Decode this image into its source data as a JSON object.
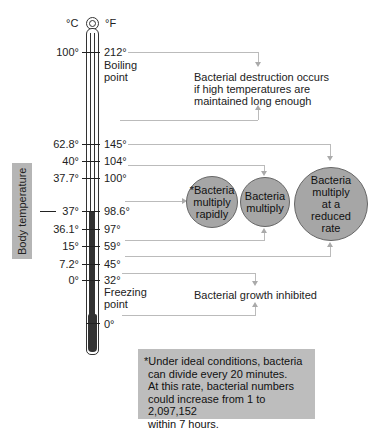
{
  "diagram": {
    "scale_headers": {
      "celsius": "°C",
      "fahrenheit": "°F"
    },
    "side_label": "Body temperature",
    "ticks": [
      {
        "c": "100°",
        "f": "212°",
        "note": "Boiling point"
      },
      {
        "c": "62.8°",
        "f": "145°"
      },
      {
        "c": "40°",
        "f": "104°"
      },
      {
        "c": "37.7°",
        "f": "100°"
      },
      {
        "c": "37°",
        "f": "98.6°"
      },
      {
        "c": "36.1°",
        "f": "97°"
      },
      {
        "c": "15°",
        "f": "59°"
      },
      {
        "c": "7.2°",
        "f": "45°"
      },
      {
        "c": "0°",
        "f": "32°",
        "note": "Freezing point"
      },
      {
        "c": "",
        "f": "0°"
      }
    ],
    "boiling_note_line1": "Boiling",
    "boiling_note_line2": "point",
    "freezing_note_line1": "Freezing",
    "freezing_note_line2": "point",
    "zones": {
      "destruction": {
        "line1": "Bacterial destruction occurs",
        "line2": "if high temperatures are",
        "line3": "maintained long enough"
      },
      "rapid": {
        "line1": "*Bacteria",
        "line2": "multiply",
        "line3": "rapidly"
      },
      "multiply": {
        "line1": "Bacteria",
        "line2": "multiply"
      },
      "reduced": {
        "line1": "Bacteria",
        "line2": "multiply",
        "line3": "at a",
        "line4": "reduced",
        "line5": "rate"
      },
      "inhibited": {
        "text": "Bacterial growth inhibited"
      }
    },
    "footnote": {
      "line1": "*Under ideal conditions, bacteria",
      "line2": "can divide every 20 minutes.",
      "line3": "At this rate, bacterial numbers",
      "line4": "could increase from 1 to 2,097,152",
      "line5": "within 7 hours."
    },
    "colors": {
      "circle_fill": "#a6a6a6",
      "note_fill": "#bdbdbd",
      "mercury": "#333333",
      "connector": "#bbbbbb"
    }
  }
}
